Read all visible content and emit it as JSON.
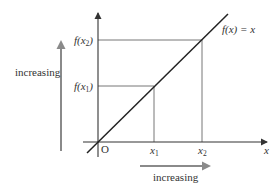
{
  "diagram": {
    "function_label": "f(x) = x",
    "origin_label": "O",
    "x_axis_label": "x",
    "x_ticks": [
      {
        "var": "x",
        "sub": "1"
      },
      {
        "var": "x",
        "sub": "2"
      }
    ],
    "y_ticks": [
      {
        "fn": "f(x",
        "sub": "1",
        "close": ")"
      },
      {
        "fn": "f(x",
        "sub": "2",
        "close": ")"
      }
    ],
    "vertical_arrow_label": "increasing",
    "horizontal_arrow_label": "increasing",
    "colors": {
      "axis": "#333333",
      "line": "#222222",
      "guides": "#777777",
      "arrows": "#8a8a8a"
    }
  }
}
